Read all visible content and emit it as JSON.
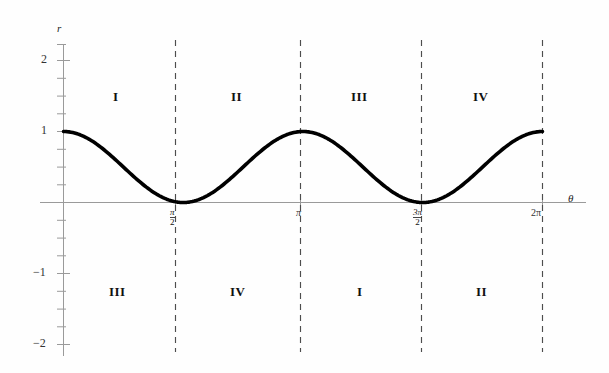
{
  "chart_data": {
    "type": "line",
    "title": "",
    "xlabel": "θ",
    "ylabel": "r",
    "xlim": [
      0,
      6.283185307
    ],
    "ylim": [
      -2.3,
      2.3
    ],
    "grid": false,
    "legend": "none",
    "function": "r = cos^2(θ)",
    "x": [
      0,
      0.3927,
      0.7854,
      1.1781,
      1.5708,
      1.9635,
      2.3562,
      2.7489,
      3.1416,
      3.5343,
      3.927,
      4.3197,
      4.7124,
      5.1051,
      5.4978,
      5.8905,
      6.2832
    ],
    "y": [
      1.0,
      0.8536,
      0.5,
      0.1464,
      0.0,
      0.1464,
      0.5,
      0.8536,
      1.0,
      0.8536,
      0.5,
      0.1464,
      0.0,
      0.1464,
      0.5,
      0.8536,
      1.0
    ],
    "y_ticks_labeled": [
      {
        "value": 2,
        "label": "2"
      },
      {
        "value": 1,
        "label": "1"
      },
      {
        "value": -1,
        "label": "−1"
      },
      {
        "value": -2,
        "label": "−2"
      }
    ],
    "y_minor_ticks": [
      -2,
      -1.75,
      -1.5,
      -1.25,
      -1,
      -0.75,
      -0.5,
      -0.25,
      0.25,
      0.5,
      0.75,
      1,
      1.25,
      1.5,
      1.75,
      2,
      2.25
    ],
    "x_ticks": [
      {
        "value": 1.5708,
        "num": "π",
        "den": "2",
        "plain": ""
      },
      {
        "value": 3.1416,
        "num": "",
        "den": "",
        "plain": "π"
      },
      {
        "value": 4.7124,
        "num": "3π",
        "den": "2",
        "plain": ""
      },
      {
        "value": 6.2832,
        "num": "",
        "den": "",
        "plain": "2π"
      }
    ],
    "dashed_lines_x": [
      1.5708,
      3.1416,
      4.7124,
      6.2832
    ],
    "curve_color": "#000000",
    "axis_color": "#8a8a8a",
    "dash_color": "#555555",
    "regions_above": [
      "I",
      "II",
      "III",
      "IV"
    ],
    "regions_below": [
      "III",
      "IV",
      "I",
      "II"
    ]
  },
  "labels": {
    "y_axis_name": "r",
    "x_axis_name": "θ",
    "y2": "2",
    "y1": "1",
    "ym1": "−1",
    "ym2": "−2",
    "xt1_num": "π",
    "xt1_den": "2",
    "xt2": "π",
    "xt3_num": "3π",
    "xt3_den": "2",
    "xt4": "2π",
    "top": {
      "r1": "I",
      "r2": "II",
      "r3": "III",
      "r4": "IV"
    },
    "bottom": {
      "r1": "III",
      "r2": "IV",
      "r3": "I",
      "r4": "II"
    }
  }
}
